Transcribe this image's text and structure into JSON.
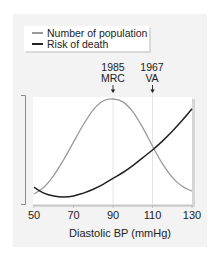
{
  "chart_data": {
    "type": "line",
    "title": "",
    "xlabel": "Diastolic BP (mmHg)",
    "ylabel": "",
    "xlim": [
      50,
      130
    ],
    "x_ticks": [
      50,
      70,
      90,
      110,
      130
    ],
    "y_ticks": [],
    "grid": false,
    "legend_position": "top-left",
    "legend": [
      "Number of population",
      "Risk of death"
    ],
    "series": [
      {
        "name": "Number of population",
        "color": "#9a9a9a",
        "x": [
          50,
          55,
          60,
          65,
          70,
          75,
          80,
          85,
          90,
          95,
          100,
          105,
          110,
          115,
          120,
          125,
          130
        ],
        "y_relative": [
          0.03,
          0.1,
          0.22,
          0.38,
          0.56,
          0.74,
          0.89,
          0.98,
          1.0,
          0.97,
          0.87,
          0.71,
          0.52,
          0.34,
          0.2,
          0.11,
          0.06
        ]
      },
      {
        "name": "Risk of death",
        "color": "#222222",
        "x": [
          50,
          55,
          60,
          65,
          70,
          75,
          80,
          85,
          90,
          95,
          100,
          105,
          110,
          115,
          120,
          125,
          130
        ],
        "y_relative": [
          0.1,
          0.04,
          0.01,
          0.0,
          0.01,
          0.04,
          0.08,
          0.13,
          0.19,
          0.25,
          0.32,
          0.4,
          0.48,
          0.57,
          0.67,
          0.78,
          0.9
        ]
      }
    ],
    "annotations": [
      {
        "label_line1": "1985",
        "label_line2": "MRC",
        "x": 90,
        "marker": "down-arrow"
      },
      {
        "label_line1": "1967",
        "label_line2": "VA",
        "x": 110,
        "marker": "down-arrow"
      }
    ]
  },
  "legend": {
    "items": [
      {
        "label": "Number of population",
        "color": "#9a9a9a"
      },
      {
        "label": "Risk of death",
        "color": "#222222"
      }
    ]
  },
  "annotations": {
    "mrc": {
      "year": "1985",
      "name": "MRC"
    },
    "va": {
      "year": "1967",
      "name": "VA"
    }
  },
  "axis": {
    "xlabel": "Diastolic BP (mmHg)",
    "ticks": [
      "50",
      "70",
      "90",
      "110",
      "130"
    ]
  }
}
